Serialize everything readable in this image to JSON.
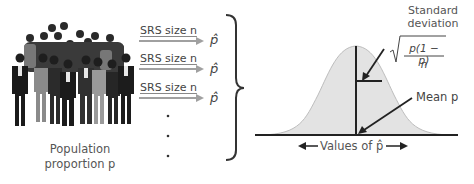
{
  "population": {
    "line1": "Population",
    "line2": "proportion p",
    "icon": "crowd-of-people"
  },
  "samples": [
    {
      "label": "SRS size n",
      "result": "p̂"
    },
    {
      "label": "SRS size n",
      "result": "p̂"
    },
    {
      "label": "SRS size n",
      "result": "p̂"
    }
  ],
  "ellipsis_dots": 3,
  "distribution": {
    "std_title_line1": "Standard",
    "std_title_line2": "deviation",
    "std_formula_numerator": "p(1 − p)",
    "std_formula_denominator": "n",
    "mean_label": "Mean p",
    "axis_label": "Values of p̂"
  },
  "colors": {
    "curve_fill": "#e3e3e3",
    "curve_stroke": "#bdbdbd",
    "arrow_gray": "#a0a0a0",
    "line_dark": "#222222"
  }
}
